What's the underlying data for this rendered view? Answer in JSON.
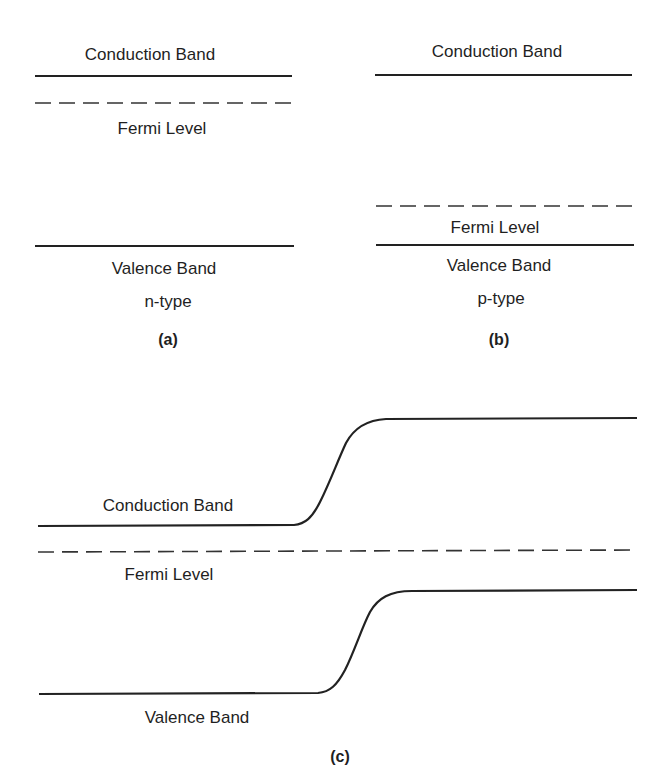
{
  "figure": {
    "panel_a": {
      "conduction_label": "Conduction Band",
      "fermi_label": "Fermi Level",
      "valence_label": "Valence Band",
      "type_label": "n-type",
      "caption": "(a)"
    },
    "panel_b": {
      "conduction_label": "Conduction Band",
      "fermi_label": "Fermi Level",
      "valence_label": "Valence Band",
      "type_label": "p-type",
      "caption": "(b)"
    },
    "panel_c": {
      "conduction_label": "Conduction Band",
      "fermi_label": "Fermi Level",
      "valence_label": "Valence Band",
      "caption": "(c)"
    }
  },
  "colors": {
    "line": "#222222",
    "text": "#1f1f1f",
    "background": "#ffffff"
  }
}
